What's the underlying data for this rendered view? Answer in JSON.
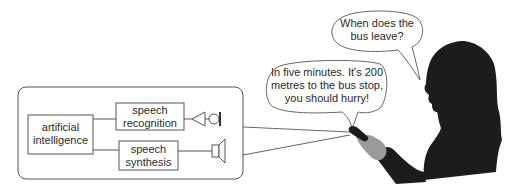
{
  "diagram": {
    "system_box": {
      "components": {
        "ai": {
          "line1": "artificial",
          "line2": "intelligence"
        },
        "speech_recognition": {
          "line1": "speech",
          "line2": "recognition"
        },
        "speech_synthesis": {
          "line1": "speech",
          "line2": "synthesis"
        }
      },
      "devices": {
        "input": "microphone-icon",
        "output": "speaker-icon"
      }
    },
    "dialogue": {
      "user_question": {
        "line1": "When does the",
        "line2": "bus leave?"
      },
      "system_answer": {
        "line1": "In five minutes. It's 200",
        "line2": "metres to the bus stop,",
        "line3": "you should hurry!"
      }
    },
    "figure": "woman-silhouette-with-phone",
    "colors": {
      "stroke": "#555555",
      "silhouette": "#1c1c1c",
      "hand": "#9a9a9a",
      "text": "#2a2a2a"
    }
  }
}
